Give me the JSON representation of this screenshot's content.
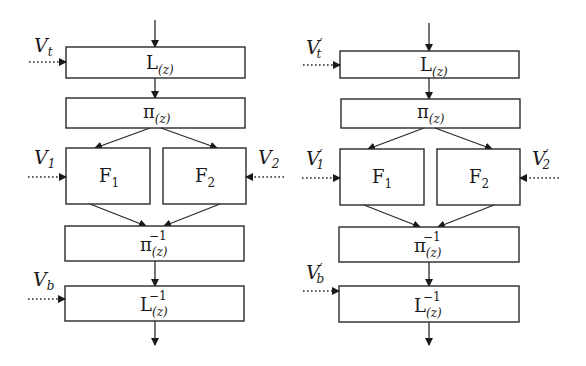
{
  "diagrams": [
    {
      "id": "left",
      "blocks": {
        "lifting": {
          "base": "L",
          "sub": "(z)",
          "sup": ""
        },
        "permutation": {
          "base": "π",
          "sub": "(z)",
          "sup": ""
        },
        "f1": {
          "base": "F",
          "sub": "1"
        },
        "f2": {
          "base": "F",
          "sub": "2"
        },
        "inv_permutation": {
          "base": "π",
          "sub": "(z)",
          "sup": "−1"
        },
        "inv_lifting": {
          "base": "L",
          "sub": "(z)",
          "sup": "−1"
        }
      },
      "inputs": {
        "vt": {
          "base": "V",
          "sub": "t",
          "prime": ""
        },
        "v1": {
          "base": "V",
          "sub": "1",
          "prime": ""
        },
        "v2": {
          "base": "V",
          "sub": "2",
          "prime": ""
        },
        "vb": {
          "base": "V",
          "sub": "b",
          "prime": ""
        }
      }
    },
    {
      "id": "right",
      "blocks": {
        "lifting": {
          "base": "L",
          "sub": "(z)",
          "sup": ""
        },
        "permutation": {
          "base": "π",
          "sub": "(z)",
          "sup": ""
        },
        "f1": {
          "base": "F",
          "sub": "1"
        },
        "f2": {
          "base": "F",
          "sub": "2"
        },
        "inv_permutation": {
          "base": "π",
          "sub": "(z)",
          "sup": "−1"
        },
        "inv_lifting": {
          "base": "L",
          "sub": "(z)",
          "sup": "−1"
        }
      },
      "inputs": {
        "vt": {
          "base": "V",
          "sub": "t",
          "prime": "′"
        },
        "v1": {
          "base": "V",
          "sub": "1",
          "prime": "′"
        },
        "v2": {
          "base": "V",
          "sub": "2",
          "prime": "′"
        },
        "vb": {
          "base": "V",
          "sub": "b",
          "prime": "′"
        }
      }
    }
  ],
  "colors": {
    "stroke": "#2a2a2a",
    "text": "#1a1a1a",
    "background": "#ffffff"
  }
}
